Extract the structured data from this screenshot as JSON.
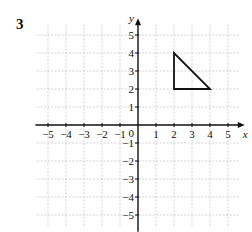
{
  "problem_number": "3",
  "graph": {
    "x_axis_label": "x",
    "y_axis_label": "y",
    "x_range": [
      -5,
      5
    ],
    "y_range": [
      -5,
      5
    ],
    "origin_label": "0",
    "x_ticks": [
      {
        "value": -5,
        "label": "−5"
      },
      {
        "value": -4,
        "label": "−4"
      },
      {
        "value": -3,
        "label": "−3"
      },
      {
        "value": -2,
        "label": "−2"
      },
      {
        "value": -1,
        "label": "−1"
      },
      {
        "value": 1,
        "label": "1"
      },
      {
        "value": 2,
        "label": "2"
      },
      {
        "value": 3,
        "label": "3"
      },
      {
        "value": 4,
        "label": "4"
      },
      {
        "value": 5,
        "label": "5"
      }
    ],
    "y_ticks": [
      {
        "value": 5,
        "label": "5"
      },
      {
        "value": 4,
        "label": "4"
      },
      {
        "value": 3,
        "label": "3"
      },
      {
        "value": 2,
        "label": "2"
      },
      {
        "value": 1,
        "label": "1"
      },
      {
        "value": -1,
        "label": "−1"
      },
      {
        "value": -2,
        "label": "−2"
      },
      {
        "value": -3,
        "label": "−3"
      },
      {
        "value": -4,
        "label": "−4"
      },
      {
        "value": -5,
        "label": "−5"
      }
    ],
    "shape": {
      "type": "triangle",
      "vertices": [
        [
          2,
          4
        ],
        [
          2,
          2
        ],
        [
          4,
          2
        ]
      ]
    },
    "colors": {
      "grid": "#c8c8c8",
      "axis": "#111111",
      "shape": "#111111"
    }
  }
}
